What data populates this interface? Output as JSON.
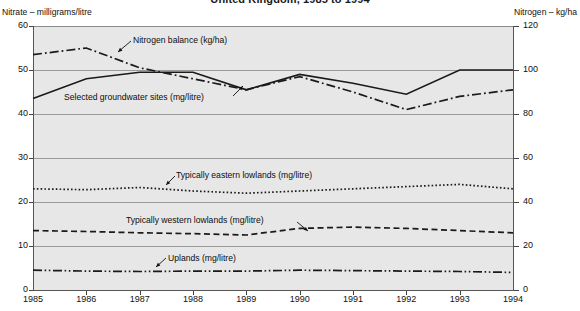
{
  "chart_data": {
    "type": "line",
    "title": "United Kingdom, 1985 to 1994",
    "xlabel": "",
    "ylabel": "Nitrate – milligrams/litre",
    "y2label": "Nitrogen – kg/ha",
    "grid": true,
    "legend_position": "inline-annotations",
    "categories": [
      "1985",
      "1986",
      "1987",
      "1988",
      "1989",
      "1990",
      "1991",
      "1992",
      "1993",
      "1994"
    ],
    "x": [
      1985,
      1986,
      1987,
      1988,
      1989,
      1990,
      1991,
      1992,
      1993,
      1994
    ],
    "ylim": [
      0,
      60
    ],
    "yticks": [
      0,
      10,
      20,
      30,
      40,
      50,
      60
    ],
    "y2lim": [
      0,
      120
    ],
    "y2ticks": [
      0,
      20,
      40,
      60,
      80,
      100,
      120
    ],
    "series": [
      {
        "name": "Nitrogen balance (kg/ha)",
        "axis": "right",
        "style": "dash-dot",
        "color": "#1a1a1a",
        "values": [
          107,
          110,
          101,
          96,
          91,
          97,
          90,
          82,
          88,
          91
        ]
      },
      {
        "name": "Selected groundwater sites (mg/litre)",
        "axis": "left",
        "style": "solid",
        "color": "#1a1a1a",
        "values": [
          43.5,
          48.0,
          49.5,
          49.5,
          45.5,
          49.0,
          47.0,
          44.5,
          50.0,
          50.0
        ]
      },
      {
        "name": "Typically eastern lowlands (mg/litre)",
        "axis": "left",
        "style": "dotted",
        "color": "#1a1a1a",
        "values": [
          23.0,
          22.8,
          23.3,
          22.5,
          22.0,
          22.5,
          23.0,
          23.5,
          24.0,
          23.0
        ]
      },
      {
        "name": "Typically western lowlands (mg/litre)",
        "axis": "left",
        "style": "dashed",
        "color": "#1a1a1a",
        "values": [
          13.5,
          13.3,
          13.0,
          12.8,
          12.5,
          14.0,
          14.3,
          14.0,
          13.5,
          13.0
        ]
      },
      {
        "name": "Uplands (mg/litre)",
        "axis": "left",
        "style": "dash-dot-dot",
        "color": "#1a1a1a",
        "values": [
          4.5,
          4.3,
          4.2,
          4.3,
          4.3,
          4.5,
          4.4,
          4.3,
          4.2,
          4.0
        ]
      }
    ],
    "annotations": [
      {
        "text": "Nitrogen balance (kg/ha)",
        "target_series": 0
      },
      {
        "text": "Selected groundwater sites (mg/litre)",
        "target_series": 1
      },
      {
        "text": "Typically eastern lowlands (mg/litre)",
        "target_series": 2
      },
      {
        "text": "Typically western lowlands (mg/litre)",
        "target_series": 3
      },
      {
        "text": "Uplands (mg/litre)",
        "target_series": 4
      }
    ],
    "colors": {
      "plot_background": "#e7e7e7",
      "gridline": "#9a9a9a",
      "axis": "#555555",
      "series": "#1a1a1a",
      "text": "#111111",
      "page_background": "#ffffff"
    }
  }
}
